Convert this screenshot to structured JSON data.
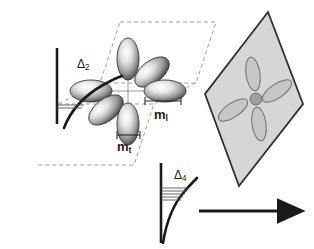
{
  "figure": {
    "background_color": "#ffffff",
    "ink_color": "#1a1a1a",
    "width": 314,
    "height": 249
  },
  "labels": {
    "delta2": {
      "symbol": "Δ",
      "subscript": "2",
      "text": "Δ2"
    },
    "delta4": {
      "symbol": "Δ",
      "subscript": "4",
      "text": "Δ4"
    },
    "mass_longitudinal": {
      "symbol": "m",
      "subscript": "l",
      "text": "ml"
    },
    "mass_transverse": {
      "symbol": "m",
      "subscript": "t",
      "text": "mt"
    },
    "axis_z": {
      "text": "z"
    }
  },
  "ellipsoid_cluster": {
    "name": "six-valley-ellipsoid-cluster",
    "center": {
      "x": 128,
      "y": 91
    },
    "count": 6,
    "fill_light": "#ffffff",
    "fill_mid": "#b9b9b9",
    "fill_dark": "#4a4a4a",
    "stroke": "#3a3a3a",
    "lobes": [
      {
        "name": "valley-up",
        "cx": 128,
        "cy": 59,
        "rx": 11,
        "ry": 21,
        "rotate": 0,
        "axis": "out-of-plane"
      },
      {
        "name": "valley-down",
        "cx": 128,
        "cy": 124,
        "rx": 11,
        "ry": 21,
        "rotate": 0,
        "axis": "out-of-plane"
      },
      {
        "name": "valley-left",
        "cx": 91,
        "cy": 91,
        "rx": 21,
        "ry": 11,
        "rotate": 0,
        "axis": "in-plane"
      },
      {
        "name": "valley-right",
        "cx": 165,
        "cy": 91,
        "rx": 21,
        "ry": 11,
        "rotate": 0,
        "axis": "in-plane"
      },
      {
        "name": "valley-upper-right",
        "cx": 152,
        "cy": 72,
        "rx": 20,
        "ry": 11,
        "rotate": -38,
        "axis": "in-plane"
      },
      {
        "name": "valley-lower-left",
        "cx": 106,
        "cy": 110,
        "rx": 20,
        "ry": 11,
        "rotate": -38,
        "axis": "in-plane"
      }
    ]
  },
  "dashed_box": {
    "name": "reciprocal-space-cell",
    "stroke": "#9a9a9a",
    "dash": "4 3",
    "top_face": [
      [
        120,
        22
      ],
      [
        216,
        22
      ],
      [
        196,
        83
      ],
      [
        100,
        83
      ]
    ],
    "bottom_face": [
      [
        58,
        104
      ],
      [
        154,
        104
      ],
      [
        134,
        165
      ],
      [
        38,
        165
      ]
    ]
  },
  "energy_diagram_upper": {
    "name": "delta2-energy-diagram",
    "axis": {
      "x": 57,
      "y_top": 48,
      "y_bottom": 124
    },
    "curve": "rising band-edge parabola",
    "level_lines": 2,
    "level_y": [
      106,
      109
    ],
    "splitting_label": "Δ2"
  },
  "energy_diagram_lower": {
    "name": "delta4-energy-diagram",
    "axis": {
      "x": 161,
      "y_top": 163,
      "y_bottom": 243
    },
    "curve": "rising band-edge parabola",
    "level_lines": 5,
    "level_y": [
      189,
      192,
      195,
      198,
      201
    ],
    "splitting_label": "Δ4"
  },
  "measure_bars": {
    "ml_bar": {
      "name": "ml-extent-bar",
      "x1": 145,
      "x2": 181,
      "y": 101
    },
    "mt_bar": {
      "name": "mt-extent-bar",
      "x1": 117,
      "x2": 140,
      "y": 135
    }
  },
  "projection_plane": {
    "name": "projection-plane-parallelogram",
    "fill": "#d6d6d6",
    "stroke": "#2e2e2e",
    "points": [
      [
        268,
        12
      ],
      [
        303,
        104
      ],
      [
        239,
        186
      ],
      [
        205,
        94
      ]
    ],
    "ellipses": [
      {
        "name": "plane-valley-up",
        "cx": 253,
        "cy": 74,
        "rx": 7,
        "ry": 17,
        "rotate": -8,
        "fill": "#c6c6c6"
      },
      {
        "name": "plane-valley-down",
        "cx": 259,
        "cy": 124,
        "rx": 7,
        "ry": 17,
        "rotate": -8,
        "fill": "#c6c6c6"
      },
      {
        "name": "plane-valley-right",
        "cx": 277,
        "cy": 91,
        "rx": 17,
        "ry": 7,
        "rotate": -34,
        "fill": "#c6c6c6"
      },
      {
        "name": "plane-valley-left",
        "cx": 233,
        "cy": 110,
        "rx": 17,
        "ry": 7,
        "rotate": -34,
        "fill": "#c6c6c6"
      }
    ],
    "center_dot": {
      "name": "plane-center-dot",
      "cx": 256,
      "cy": 99,
      "r": 6,
      "fill": "#9f9f9f"
    }
  },
  "z_arrow": {
    "name": "z-axis-arrow",
    "x1": 199,
    "x2": 283,
    "y": 211,
    "stroke": "#1a1a1a",
    "stroke_width": 3.2,
    "label": "z"
  }
}
